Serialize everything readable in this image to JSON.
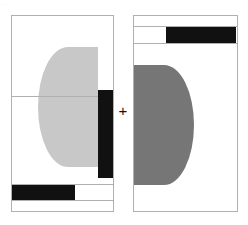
{
  "figure": {
    "width": 248,
    "height": 225,
    "background_color": "#ffffff",
    "operator_symbol": "+",
    "corner_artifact_text": "··",
    "panel_border_color": "#b0b0b0"
  },
  "palette": {
    "white": "#ffffff",
    "black": "#111111",
    "light_gray": "#c8c8c8",
    "mid_gray": "#767676",
    "line_gray": "#b0b0b0"
  },
  "left_panel": {
    "label": "left-panel",
    "frame": {
      "x": 11,
      "y": 15,
      "w": 103,
      "h": 197
    },
    "disc": {
      "label": "light-gray-half-disc",
      "fill": "#c8c8c8",
      "orientation": "left-half",
      "center_x": 98,
      "center_y": 107,
      "radius": 60
    },
    "bars": [
      {
        "label": "vertical-black-bar",
        "fill": "#111111",
        "x": 98,
        "y": 90,
        "w": 15,
        "h": 88
      },
      {
        "label": "horizontal-black-bar",
        "fill": "#111111",
        "x": 12,
        "y": 185,
        "w": 63,
        "h": 15
      }
    ],
    "rules": [
      {
        "label": "upper-divider",
        "x": 12,
        "y": 96,
        "w": 101
      },
      {
        "label": "lower-divider-top",
        "x": 12,
        "y": 184,
        "w": 101
      },
      {
        "label": "lower-divider-bottom",
        "x": 12,
        "y": 200,
        "w": 101
      }
    ]
  },
  "right_panel": {
    "label": "right-panel",
    "frame": {
      "x": 133,
      "y": 15,
      "w": 105,
      "h": 197
    },
    "disc": {
      "label": "mid-gray-half-disc",
      "fill": "#767676",
      "orientation": "right-half",
      "center_x": 134,
      "center_y": 125,
      "radius": 60
    },
    "bars": [
      {
        "label": "top-black-bar",
        "fill": "#111111",
        "x": 166,
        "y": 27,
        "w": 70,
        "h": 16
      }
    ],
    "rules": [
      {
        "label": "upper-divider-top",
        "x": 134,
        "y": 26,
        "w": 103
      },
      {
        "label": "upper-divider-bottom",
        "x": 134,
        "y": 43,
        "w": 103
      }
    ]
  }
}
